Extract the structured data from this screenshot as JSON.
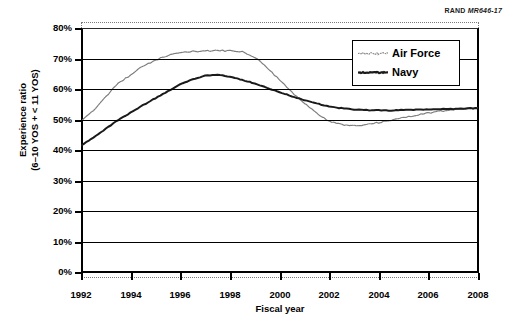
{
  "source_credit": {
    "prefix": "RAND",
    "id": "MR646-17"
  },
  "axis": {
    "y_title_line1": "Experience ratio",
    "y_title_line2": "(6–10 YOS + < 11 YOS)",
    "x_title": "Fiscal year",
    "y_ticks": [
      "0%",
      "10%",
      "20%",
      "30%",
      "40%",
      "50%",
      "60%",
      "70%",
      "80%"
    ],
    "x_ticks": [
      "1992",
      "1994",
      "1996",
      "1998",
      "2000",
      "2002",
      "2004",
      "2006",
      "2008"
    ]
  },
  "legend": {
    "items": [
      {
        "label": "Air Force",
        "color": "#7d7d7d",
        "style": "zigzag-light"
      },
      {
        "label": "Navy",
        "color": "#1a1a1a",
        "style": "solid-dark"
      }
    ]
  },
  "chart_data": {
    "type": "line",
    "title": "",
    "xlabel": "Fiscal year",
    "ylabel": "Experience ratio (6–10 YOS + < 11 YOS)",
    "xlim": [
      1992,
      2008
    ],
    "ylim": [
      0,
      80
    ],
    "ytick_interval": 10,
    "xtick_interval": 2,
    "grid": true,
    "legend_position": "top-right",
    "y_unit": "percent",
    "x": [
      1992,
      1992.5,
      1993,
      1993.5,
      1994,
      1994.5,
      1995,
      1995.5,
      1996,
      1996.5,
      1997,
      1997.5,
      1998,
      1998.5,
      1999,
      1999.5,
      2000,
      2000.5,
      2001,
      2001.5,
      2002,
      2002.5,
      2003,
      2003.5,
      2004,
      2004.5,
      2005,
      2005.5,
      2006,
      2006.5,
      2007,
      2007.5,
      2008
    ],
    "series": [
      {
        "name": "Air Force",
        "color": "#7d7d7d",
        "values": [
          49.5,
          53.0,
          57.5,
          62.0,
          64.5,
          67.5,
          69.5,
          71.0,
          71.8,
          72.3,
          72.5,
          72.6,
          72.5,
          72.3,
          70.5,
          67.0,
          63.0,
          59.0,
          55.5,
          52.0,
          49.5,
          48.3,
          48.0,
          48.3,
          49.0,
          49.8,
          50.6,
          51.4,
          52.1,
          52.7,
          53.2,
          53.5,
          53.7
        ]
      },
      {
        "name": "Navy",
        "color": "#1a1a1a",
        "values": [
          41.5,
          44.0,
          47.0,
          49.8,
          52.3,
          54.7,
          57.0,
          59.3,
          61.5,
          63.2,
          64.4,
          64.7,
          64.0,
          63.0,
          61.8,
          60.4,
          59.0,
          57.6,
          56.3,
          55.2,
          54.3,
          53.7,
          53.3,
          53.1,
          53.0,
          53.0,
          53.1,
          53.2,
          53.3,
          53.4,
          53.5,
          53.6,
          53.7
        ]
      }
    ]
  }
}
